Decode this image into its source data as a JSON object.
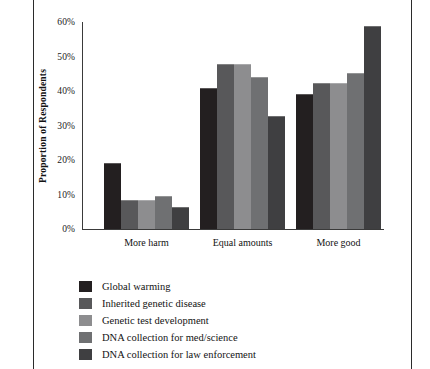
{
  "chart_data": {
    "type": "bar",
    "title": "",
    "subtitle": "",
    "xlabel": "",
    "ylabel": "Proportion of Respondents",
    "categories": [
      "More harm",
      "Equal amounts",
      "More good"
    ],
    "ylim": [
      0,
      60
    ],
    "ytick_values": [
      60,
      50,
      40,
      30,
      20,
      10,
      0
    ],
    "ytick_labels": [
      "60%",
      "50%",
      "40%",
      "30%",
      "20%",
      "10%",
      "0%"
    ],
    "grid": false,
    "legend_position": "below",
    "series": [
      {
        "name": "Global warming",
        "color": "#231f20",
        "values": [
          19.0,
          41.0,
          39.0
        ]
      },
      {
        "name": "Inherited genetic disease",
        "color": "#58585a",
        "values": [
          8.5,
          47.8,
          42.2
        ]
      },
      {
        "name": "Genetic test development",
        "color": "#8d8d8f",
        "values": [
          8.5,
          47.8,
          42.2
        ]
      },
      {
        "name": "DNA collection for med/science",
        "color": "#6f7072",
        "values": [
          9.5,
          44.0,
          45.2
        ]
      },
      {
        "name": "DNA collection for law enforcement",
        "color": "#3f3f41",
        "values": [
          6.5,
          32.8,
          58.8
        ]
      }
    ]
  }
}
